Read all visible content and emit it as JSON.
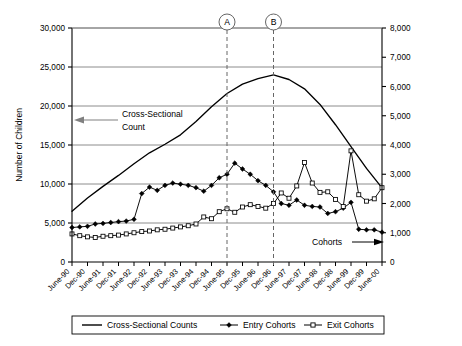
{
  "chart_data": {
    "type": "line",
    "title": "",
    "xlabel": "",
    "ylabel": "Number of Children",
    "y2label": "",
    "ylim": [
      0,
      30000
    ],
    "y2lim": [
      0,
      8000
    ],
    "grid": true,
    "legend_position": "bottom",
    "yticks": [
      "0",
      "5,000",
      "10,000",
      "15,000",
      "20,000",
      "25,000",
      "30,000"
    ],
    "ytick_values": [
      0,
      5000,
      10000,
      15000,
      20000,
      25000,
      30000
    ],
    "y2ticks": [
      "0",
      "1,000",
      "2,000",
      "3,000",
      "4,000",
      "5,000",
      "6,000",
      "7,000",
      "8,000"
    ],
    "y2tick_values": [
      0,
      1000,
      2000,
      3000,
      4000,
      5000,
      6000,
      7000,
      8000
    ],
    "categories": [
      "June-90",
      "Dec-90",
      "June-91",
      "Dec-91",
      "June-92",
      "Dec-92",
      "June-93",
      "Dec-93",
      "June-94",
      "Dec-94",
      "June-95",
      "Dec-95",
      "June-96",
      "Dec-96",
      "June-97",
      "Dec-97",
      "June-98",
      "Dec-98",
      "June-99",
      "Dec-99",
      "June-00"
    ],
    "series": [
      {
        "name": "Cross-Sectional Counts",
        "axis": "left",
        "marker": "none",
        "values": [
          6500,
          8200,
          9700,
          11100,
          12600,
          14000,
          15100,
          16300,
          18000,
          19900,
          21600,
          22800,
          23500,
          24000,
          23400,
          22200,
          20200,
          17600,
          14800,
          12000,
          9500
        ]
      },
      {
        "name": "Entry Cohorts",
        "axis": "right",
        "marker": "filled-diamond",
        "x_quarterly": [
          "Jun-90",
          "Sep-90",
          "Dec-90",
          "Mar-91",
          "Jun-91",
          "Sep-91",
          "Dec-91",
          "Mar-92",
          "Jun-92",
          "Sep-92",
          "Dec-92",
          "Mar-93",
          "Jun-93",
          "Sep-93",
          "Dec-93",
          "Mar-94",
          "Jun-94",
          "Sep-94",
          "Dec-94",
          "Mar-95",
          "Jun-95",
          "Sep-95",
          "Dec-95",
          "Mar-96",
          "Jun-96",
          "Sep-96",
          "Dec-96",
          "Mar-97",
          "Jun-97",
          "Sep-97",
          "Dec-97",
          "Mar-98",
          "Jun-98",
          "Sep-98",
          "Dec-98",
          "Mar-99",
          "Jun-99",
          "Sep-99",
          "Dec-99",
          "Mar-00",
          "Jun-00"
        ],
        "values_right_axis": [
          1180,
          1200,
          1220,
          1300,
          1320,
          1350,
          1380,
          1400,
          1460,
          2340,
          2560,
          2450,
          2620,
          2700,
          2660,
          2620,
          2540,
          2420,
          2620,
          2880,
          3000,
          3380,
          3180,
          3000,
          2780,
          2620,
          2400,
          2000,
          1940,
          2120,
          1940,
          1900,
          1880,
          1660,
          1720,
          1840,
          2040,
          1120,
          1100,
          1100,
          1020
        ]
      },
      {
        "name": "Exit Cohorts",
        "axis": "right",
        "marker": "open-square",
        "x_quarterly": [
          "Jun-90",
          "Sep-90",
          "Dec-90",
          "Mar-91",
          "Jun-91",
          "Sep-91",
          "Dec-91",
          "Mar-92",
          "Jun-92",
          "Sep-92",
          "Dec-92",
          "Mar-93",
          "Jun-93",
          "Sep-93",
          "Dec-93",
          "Mar-94",
          "Jun-94",
          "Sep-94",
          "Dec-94",
          "Mar-95",
          "Jun-95",
          "Sep-95",
          "Dec-95",
          "Mar-96",
          "Jun-96",
          "Sep-96",
          "Dec-96",
          "Mar-97",
          "Jun-97",
          "Sep-97",
          "Dec-97",
          "Mar-98",
          "Jun-98",
          "Sep-98",
          "Dec-98",
          "Mar-99",
          "Jun-99",
          "Sep-99",
          "Dec-99",
          "Mar-00",
          "Jun-00"
        ],
        "values_right_axis": [
          960,
          900,
          860,
          840,
          880,
          900,
          920,
          960,
          1000,
          1040,
          1060,
          1100,
          1120,
          1160,
          1200,
          1240,
          1300,
          1540,
          1480,
          1720,
          1820,
          1700,
          1880,
          1960,
          1900,
          1840,
          2000,
          2360,
          2180,
          2600,
          3400,
          2700,
          2380,
          2400,
          2140,
          1900,
          3800,
          2300,
          2080,
          2160,
          2540
        ]
      }
    ],
    "markers": [
      {
        "label": "A",
        "category": "June-95",
        "x_fraction": 0.5
      },
      {
        "label": "B",
        "category": "Dec-96",
        "x_fraction": 0.65
      }
    ],
    "annotations": [
      {
        "name": "cross-sectional-annotation",
        "text": "Cross-Sectional\nCount",
        "line1": "Cross-Sectional",
        "line2": "Count",
        "arrow": "left"
      },
      {
        "name": "cohorts-annotation",
        "text": "Cohorts",
        "line1": "Cohorts",
        "arrow": "right"
      }
    ],
    "legend": [
      {
        "label": "Cross-Sectional Counts",
        "marker": "line"
      },
      {
        "label": "Entry Cohorts",
        "marker": "filled-diamond"
      },
      {
        "label": "Exit Cohorts",
        "marker": "open-square"
      }
    ],
    "colors": {
      "line": "#000000",
      "grid": "#808080",
      "axis": "#000000",
      "marker_dashed": "#666666",
      "annotation_arrow": "#808080"
    }
  }
}
